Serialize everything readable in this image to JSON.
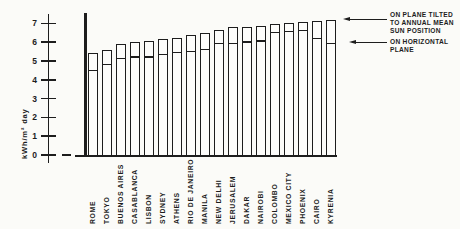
{
  "figure": {
    "background": "#fbfbf8",
    "ink": "#1d1d1d"
  },
  "legend": {
    "tilted_label_lines": [
      "ON PLANE TILTED",
      "TO ANNUAL MEAN",
      "SUN POSITION"
    ],
    "horizontal_label_lines": [
      "ON HORIZONTAL",
      "PLANE"
    ]
  },
  "chart_data": {
    "type": "bar",
    "title": "",
    "xlabel": "",
    "ylabel": "kWh/m² day",
    "ylim": [
      0,
      7
    ],
    "yticks": [
      0,
      1,
      2,
      3,
      4,
      5,
      6,
      7
    ],
    "grid": false,
    "legend_position": "right",
    "categories": [
      "ROME",
      "TOKYO",
      "BUENOS AIRES",
      "CASABLANCA",
      "LISBON",
      "SYDNEY",
      "ATHENS",
      "RIO DE JANEIRO",
      "MANILA",
      "NEW DELHI",
      "JERUSALEM",
      "DAKAR",
      "NAIROBI",
      "COLOMBO",
      "MEXICO CITY",
      "PHOENIX",
      "CAIRO",
      "KYRENIA"
    ],
    "series": [
      {
        "name": "ON PLANE TILTED TO ANNUAL MEAN SUN POSITION",
        "values": [
          5.4,
          5.6,
          5.9,
          6.0,
          6.05,
          6.15,
          6.25,
          6.4,
          6.5,
          6.65,
          6.8,
          6.8,
          6.85,
          6.95,
          7.0,
          7.05,
          7.15,
          7.2
        ]
      },
      {
        "name": "ON HORIZONTAL PLANE",
        "values": [
          4.6,
          4.9,
          5.2,
          5.3,
          5.3,
          5.45,
          5.55,
          5.6,
          5.7,
          6.0,
          6.0,
          6.1,
          6.15,
          6.6,
          6.65,
          6.7,
          6.3,
          6.0
        ]
      }
    ]
  }
}
